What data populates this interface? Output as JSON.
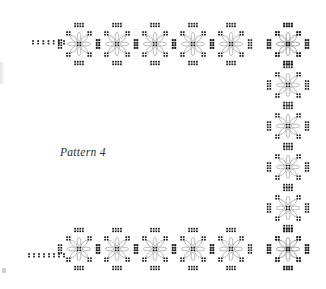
{
  "page": {
    "width": 326,
    "height": 289,
    "background_color": "#ffffff",
    "title": "Pattern 4"
  },
  "caption": {
    "text": "Pattern 4",
    "x": 60,
    "y": 146,
    "font_style": "italic-serif",
    "color": "#2b2b2b"
  },
  "style": {
    "petal_stroke_color": "#8a8a8a",
    "petal_fill_color": "#ffffff",
    "dot_color": "#1a1a1a",
    "dot_size": 1.7,
    "dot_spacing": 2.6,
    "stroke_width": 0.6,
    "edge_mark_color": "#cfcfcf"
  },
  "motif": {
    "name": "eight-petal-flower",
    "petal_count": 8,
    "petal_length": 9.2,
    "petal_width": 4.0,
    "petal_inner_radius": 2.6,
    "cluster_rows": 2,
    "cluster_cols": 4,
    "cluster_offset": 12.0,
    "corner_cluster_offset": 9.4,
    "description": "Eight teardrop petals radiating from a center point, ringed by square dot clusters at the four cardinal and four diagonal positions."
  },
  "border": {
    "shape": "inverted-U bracket (top row, right column, bottom row; left side open)",
    "top_row": {
      "label": "top-flower-row",
      "count": 6,
      "y": 44,
      "x_positions": [
        79,
        117,
        155,
        193,
        231,
        288
      ]
    },
    "right_column": {
      "label": "right-flower-column",
      "count": 6,
      "x": 288,
      "y_positions": [
        44,
        85,
        126,
        167,
        208,
        249
      ]
    },
    "bottom_row": {
      "label": "bottom-flower-row",
      "count": 6,
      "y": 249,
      "x_positions": [
        79,
        117,
        155,
        193,
        231,
        288
      ]
    },
    "tails": [
      {
        "label": "top-left-dotted-tail",
        "x_start": 33,
        "x_end": 64,
        "y": 41,
        "rows": 2,
        "dot_count_per_row": 7
      },
      {
        "label": "bottom-left-dotted-tail",
        "x_start": 29,
        "x_end": 64,
        "y": 254,
        "rows": 2,
        "dot_count_per_row": 8
      }
    ]
  },
  "artifacts": [
    {
      "label": "edge-mark-bottom-left",
      "x": 2,
      "y": 268,
      "width": 4,
      "height": 5
    },
    {
      "label": "edge-smudge-left",
      "x": 0,
      "y": 62,
      "width": 5,
      "height": 22
    }
  ]
}
